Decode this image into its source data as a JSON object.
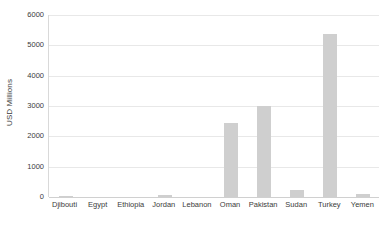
{
  "chart_data": {
    "type": "bar",
    "title": "",
    "xlabel": "",
    "ylabel": "USD Millions",
    "ylim": [
      0,
      6000
    ],
    "yticks": [
      0,
      1000,
      2000,
      3000,
      4000,
      5000,
      6000
    ],
    "ytick_labels": [
      "0",
      "1000",
      "2000",
      "3000",
      "4000",
      "5000",
      "6000"
    ],
    "grid": true,
    "legend": false,
    "bar_color": "#cfcfcf",
    "categories": [
      "Djibouti",
      "Egypt",
      "Ethiopia",
      "Jordan",
      "Lebanon",
      "Oman",
      "Pakistan",
      "Sudan",
      "Turkey",
      "Yemen"
    ],
    "values": [
      30,
      0,
      0,
      70,
      0,
      2440,
      3000,
      230,
      5370,
      100
    ]
  }
}
